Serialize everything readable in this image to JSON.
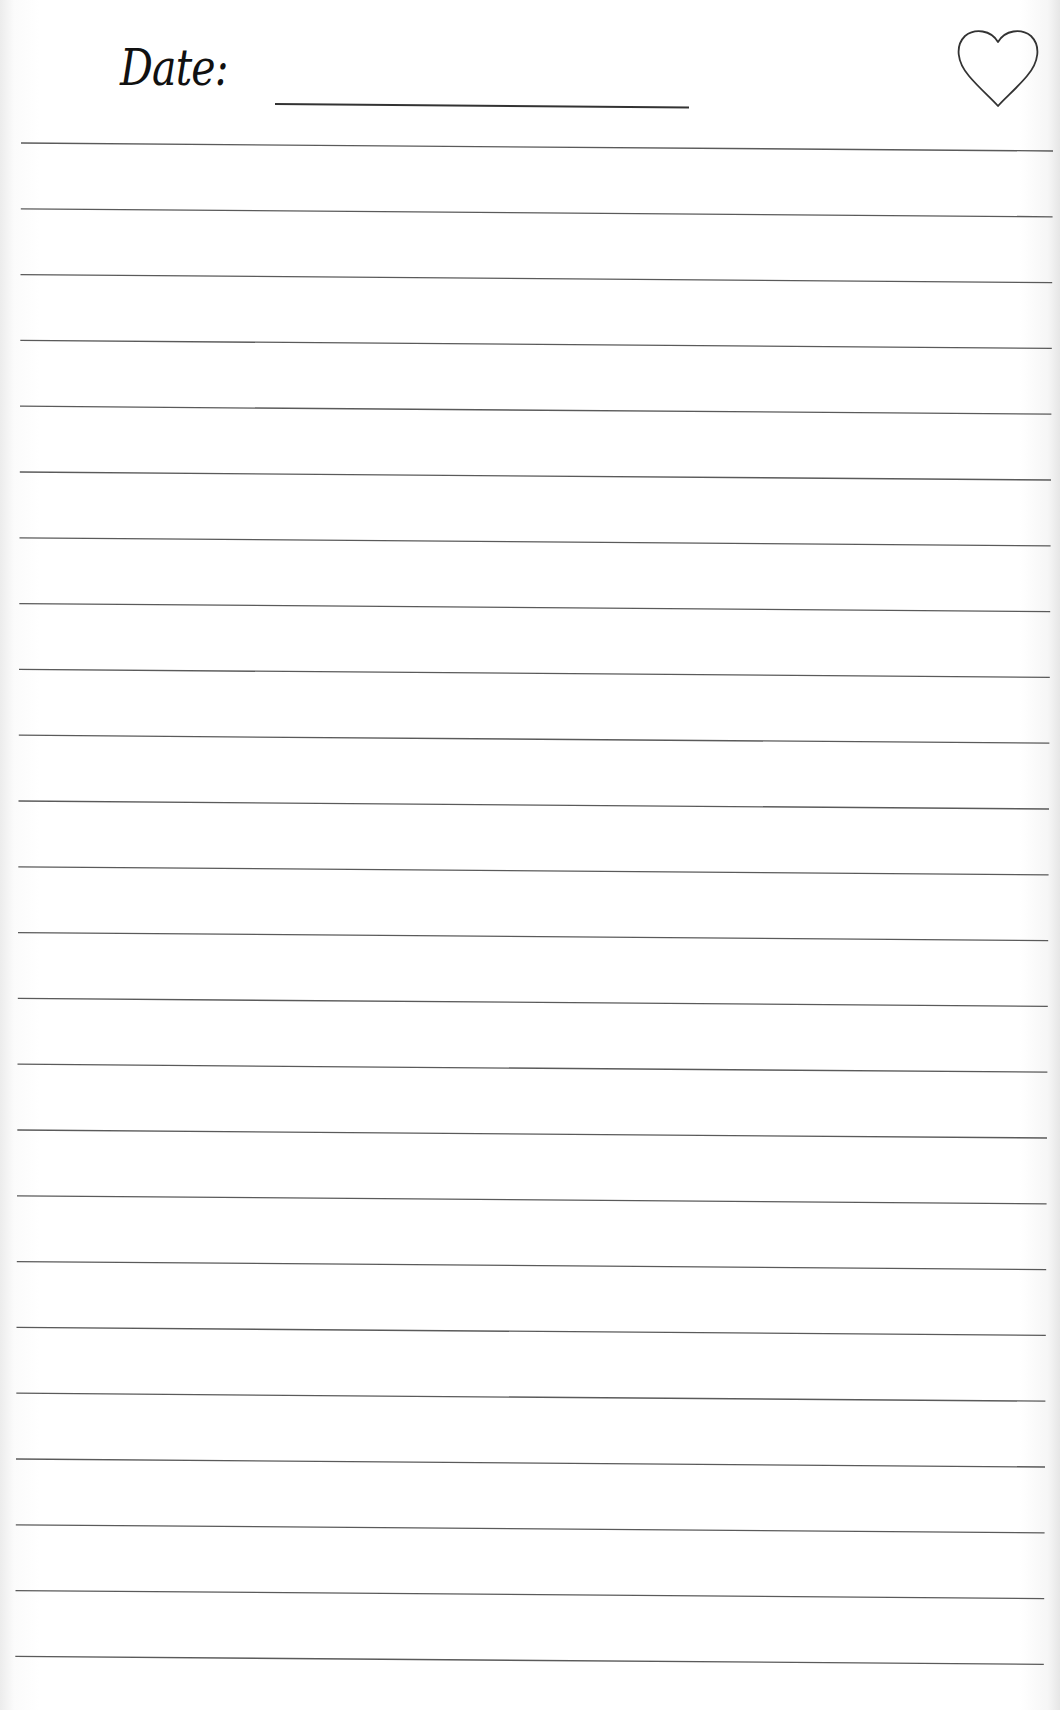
{
  "header": {
    "date_label": "Date:",
    "date_value": "",
    "favorite_icon": "heart-outline-icon"
  },
  "ruled_lines": {
    "count": 24,
    "color": "#5a5a5a"
  }
}
